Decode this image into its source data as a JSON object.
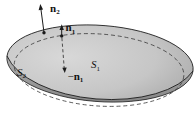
{
  "figure": {
    "labels": {
      "n2": {
        "base": "n",
        "sub": "2"
      },
      "n1": {
        "base": "n",
        "sub": "1"
      },
      "neg_n1": {
        "sign": "−",
        "base": "n",
        "sub": "1"
      },
      "s1": {
        "base": "S",
        "sub": "1"
      },
      "s2": {
        "base": "S",
        "sub": "2"
      }
    },
    "colors": {
      "background": "#ffffff",
      "surface_light": "#d8d8d8",
      "surface_mid": "#c6c6c6",
      "surface_dark": "#a2a2a2",
      "rim_top": "#b2b2b2",
      "rim_bottom": "#868686",
      "outline": "#1c1c1c",
      "dash": "#3c3c3c",
      "point": "#1a1a1a"
    }
  }
}
